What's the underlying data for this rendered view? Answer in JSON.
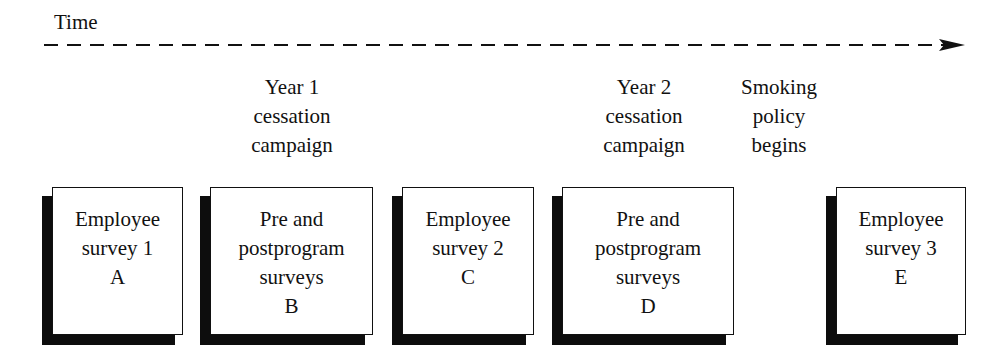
{
  "diagram": {
    "type": "timeline-study-design",
    "time_axis": {
      "label": "Time",
      "style": "dashed",
      "direction": "left-to-right",
      "arrowhead": "right"
    },
    "events": [
      {
        "id": "year1",
        "lines": [
          "Year 1",
          "cessation",
          "campaign"
        ],
        "center_x": 292
      },
      {
        "id": "year2",
        "lines": [
          "Year 2",
          "cessation",
          "campaign"
        ],
        "center_x": 644
      },
      {
        "id": "policy",
        "lines": [
          "Smoking",
          "policy",
          "begins"
        ],
        "center_x": 779
      }
    ],
    "boxes": [
      {
        "id": "A",
        "lines": [
          "Employee",
          "survey 1",
          "A"
        ],
        "left": 52,
        "width": 131
      },
      {
        "id": "B",
        "lines": [
          "Pre and",
          "postprogram",
          "surveys",
          "B"
        ],
        "left": 210,
        "width": 163
      },
      {
        "id": "C",
        "lines": [
          "Employee",
          "survey 2",
          "C"
        ],
        "left": 402,
        "width": 132
      },
      {
        "id": "D",
        "lines": [
          "Pre and",
          "postprogram",
          "surveys",
          "D"
        ],
        "left": 562,
        "width": 172
      },
      {
        "id": "E",
        "lines": [
          "Employee",
          "survey 3",
          "E"
        ],
        "left": 836,
        "width": 130
      }
    ],
    "colors": {
      "background": "#ffffff",
      "ink": "#111111",
      "shadow": "#0d0d0d"
    }
  }
}
